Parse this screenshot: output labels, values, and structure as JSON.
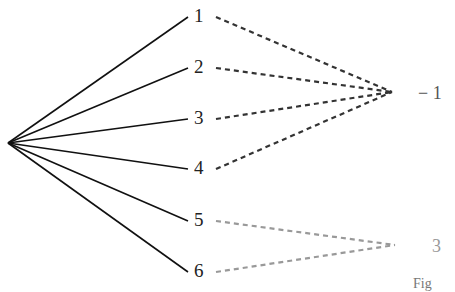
{
  "diagram": {
    "root": {
      "x": 8,
      "y": 143
    },
    "outcomes": [
      {
        "label": "1",
        "x": 200,
        "y": 15
      },
      {
        "label": "2",
        "x": 200,
        "y": 66
      },
      {
        "label": "3",
        "x": 200,
        "y": 117
      },
      {
        "label": "4",
        "x": 200,
        "y": 167
      },
      {
        "label": "5",
        "x": 200,
        "y": 219
      },
      {
        "label": "6",
        "x": 200,
        "y": 270
      }
    ],
    "results": [
      {
        "label": "− 1",
        "x": 392,
        "y": 92,
        "color": "#333333",
        "from": [
          0,
          1,
          2,
          3
        ]
      },
      {
        "label": "3",
        "x": 395,
        "y": 245,
        "color": "#999999",
        "from": [
          4,
          5
        ]
      }
    ],
    "caption": "Fig"
  }
}
